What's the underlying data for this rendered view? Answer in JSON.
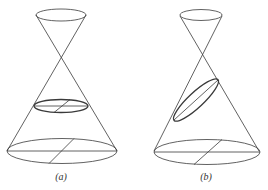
{
  "figures": [
    {
      "id": "a",
      "label": "(a)",
      "description": "Double cone cut by a plane perpendicular to the axis, giving a circle",
      "label_pos": [
        61,
        172
      ]
    },
    {
      "id": "b",
      "label": "(b)",
      "description": "Double cone cut by an oblique plane, giving an ellipse",
      "label_pos": [
        206,
        172
      ]
    }
  ],
  "colors": {
    "stroke": "#3a3a3a",
    "background": "#ffffff"
  }
}
